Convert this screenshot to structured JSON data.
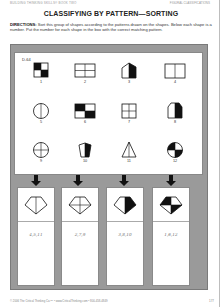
{
  "header": {
    "left": "BUILDING THINKING SKILLS® BOOK TWO",
    "right": "FIGURAL CLASSIFICATIONS"
  },
  "title": "CLASSIFYING BY PATTERN—SORTING",
  "directions": {
    "label": "DIRECTIONS:",
    "text": " Sort this group of shapes according to the patterns drawn on the shapes. Below each shape is a number. Put the number for each shape in the box with the correct matching pattern."
  },
  "exercise": {
    "code": "D-64",
    "shapes": [
      {
        "number": "1",
        "type": "square-quadrants-checkered"
      },
      {
        "number": "2",
        "type": "rectangle-quadrants"
      },
      {
        "number": "3",
        "type": "house-half-shaded"
      },
      {
        "number": "4",
        "type": "rectangle-halves"
      },
      {
        "number": "5",
        "type": "circle-halves"
      },
      {
        "number": "6",
        "type": "rectangle-quadrants-checkered"
      },
      {
        "number": "7",
        "type": "square-quadrants"
      },
      {
        "number": "8",
        "type": "octagon-half-shaded"
      },
      {
        "number": "9",
        "type": "circle-quadrants"
      },
      {
        "number": "10",
        "type": "pentagon-half-shaded"
      },
      {
        "number": "11",
        "type": "triangle-halves"
      },
      {
        "number": "12",
        "type": "circle-quadrants-checkered"
      }
    ],
    "categories": [
      {
        "pattern": "diamond-halves",
        "answer": "4,5,11"
      },
      {
        "pattern": "diamond-quadrants",
        "answer": "2,7,9"
      },
      {
        "pattern": "diamond-half-shaded",
        "answer": "3,8,10"
      },
      {
        "pattern": "diamond-quadrants-checkered",
        "answer": "1,6,12"
      }
    ]
  },
  "footer": {
    "copyright": "© 2006 The Critical Thinking Co.™ • www.CriticalThinking.com • 800-458-4849",
    "page_number": "177"
  },
  "colors": {
    "frame": "#9a9a9a",
    "ink": "#111111",
    "answer_ink": "#777777"
  }
}
